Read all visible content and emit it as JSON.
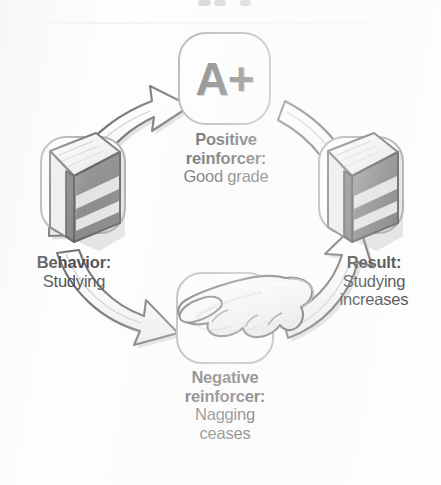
{
  "figure": {
    "kind": "reinforcement-cycle-diagram",
    "flow_direction": "clockwise",
    "background_color": "#fdfdfd",
    "ink_color": "#1b1b1b",
    "arrow_fill": "#f2f2f2",
    "arrow_outline": "#4a4a4a",
    "icon_box_outline": "#9a9a9a"
  },
  "nodes": {
    "grade": {
      "icon": "grade-a-plus-icon",
      "glyph": "A+"
    },
    "behavior": {
      "icon": "book-icon",
      "heading": "Behavior:",
      "body": "Studying"
    },
    "positive": {
      "heading_line1": "Positive",
      "heading_line2": "reinforcer:",
      "body": "Good grade"
    },
    "result": {
      "icon": "book-icon",
      "heading": "Result:",
      "body_line1": "Studying",
      "body_line2": "increases"
    },
    "negative": {
      "icon": "nagging-hand-icon",
      "heading_line1": "Negative",
      "heading_line2": "reinforcer:",
      "body_line1": "Nagging",
      "body_line2": "ceases"
    }
  },
  "arrows": [
    {
      "name": "arrow-behavior-to-grade",
      "from": "behavior",
      "to": "grade",
      "direction": "up-right"
    },
    {
      "name": "arrow-grade-to-result",
      "from": "grade",
      "to": "result",
      "direction": "down-right"
    },
    {
      "name": "arrow-behavior-to-negative",
      "from": "behavior",
      "to": "negative",
      "direction": "down-right"
    },
    {
      "name": "arrow-negative-to-result",
      "from": "negative",
      "to": "result",
      "direction": "up-right"
    }
  ]
}
